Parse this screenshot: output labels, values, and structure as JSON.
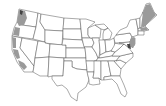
{
  "map": {
    "title": "",
    "region": "Contiguous United States",
    "style": "state outline map",
    "colors": {
      "background": "#ffffff",
      "state_fill": "#ffffff",
      "state_border": "#555555",
      "highlight_fill": "#9a9a9a",
      "highlight_dark": "#444444"
    },
    "highlighted_regions": [
      {
        "name": "Pacific Northwest coast",
        "states": [
          "Washington",
          "Oregon"
        ]
      },
      {
        "name": "California coast",
        "states": [
          "California"
        ]
      },
      {
        "name": "New England",
        "states": [
          "Maine",
          "New Hampshire",
          "Vermont",
          "Massachusetts"
        ]
      },
      {
        "name": "Mid-Atlantic coast",
        "states": [
          "New Jersey",
          "Delaware",
          "Maryland"
        ]
      }
    ]
  }
}
